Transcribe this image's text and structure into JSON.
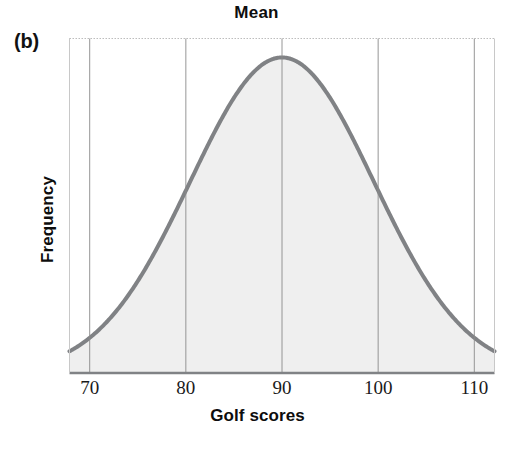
{
  "figure": {
    "panel_label": "(b)",
    "title": "Mean",
    "xlabel": "Golf scores",
    "ylabel": "Frequency"
  },
  "style": {
    "curve_color": "#808285",
    "fill_color": "#efefef",
    "grid_color": "#8a8a8a",
    "frame_color": "#b0b0b0",
    "axis_color": "#808285",
    "text_color": "#0d0d0d"
  },
  "chart_data": {
    "type": "line",
    "title": "Mean",
    "xlabel": "Golf scores",
    "ylabel": "Frequency",
    "xlim": [
      67.9,
      112.1
    ],
    "ylim": [
      0,
      1.06
    ],
    "xticks": [
      70,
      80,
      90,
      100,
      110
    ],
    "xticklabels": [
      "70",
      "80",
      "90",
      "100",
      "110"
    ],
    "yticks": [],
    "yticklabels": [],
    "grid": true,
    "grid_axis": "x",
    "legend": false,
    "annotations": [
      {
        "text": "Mean",
        "x": 90,
        "y": 1.06,
        "note": "title placed directly above the vertical gridline at the distribution mean"
      },
      {
        "text": "(b)",
        "x": 67.9,
        "y": 1.06,
        "note": "panel identifier at upper-left, outside the axes"
      }
    ],
    "series": [
      {
        "name": "Golf score distribution",
        "type": "normal_curve",
        "mean": 90,
        "std": 9.55,
        "peak_value": 1.0,
        "filled": true,
        "x": [
          68,
          70,
          72,
          74,
          76,
          78,
          80,
          82,
          84,
          86,
          88,
          90,
          92,
          94,
          96,
          98,
          100,
          102,
          104,
          106,
          108,
          110,
          112
        ],
        "y": [
          0.032,
          0.054,
          0.086,
          0.131,
          0.19,
          0.264,
          0.351,
          0.447,
          0.545,
          0.68,
          0.819,
          1.0,
          0.819,
          0.68,
          0.545,
          0.447,
          0.351,
          0.264,
          0.19,
          0.131,
          0.086,
          0.054,
          0.032
        ]
      }
    ]
  }
}
